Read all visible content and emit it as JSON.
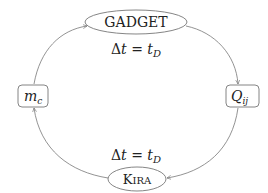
{
  "diagram": {
    "nodes": {
      "gadget": {
        "label": "GADGET",
        "shape": "ellipse"
      },
      "kira": {
        "label_first": "K",
        "label_rest": "IRA",
        "shape": "ellipse"
      },
      "mc": {
        "label_base": "m",
        "label_sub": "c",
        "shape": "rounded-box"
      },
      "qij": {
        "label_base": "Q",
        "label_sub": "ij",
        "shape": "rounded-box"
      }
    },
    "edges": [
      {
        "from": "mc",
        "to": "gadget"
      },
      {
        "from": "gadget",
        "to": "qij"
      },
      {
        "from": "qij",
        "to": "kira"
      },
      {
        "from": "kira",
        "to": "mc"
      }
    ],
    "annotations": {
      "top": {
        "delta": "Δ",
        "t": "t",
        "eq": " = ",
        "t2": "t",
        "sub": "D"
      },
      "bottom": {
        "delta": "Δ",
        "t": "t",
        "eq": " = ",
        "t2": "t",
        "sub": "D"
      }
    },
    "colors": {
      "stroke": "#777777",
      "text": "#222222"
    }
  }
}
